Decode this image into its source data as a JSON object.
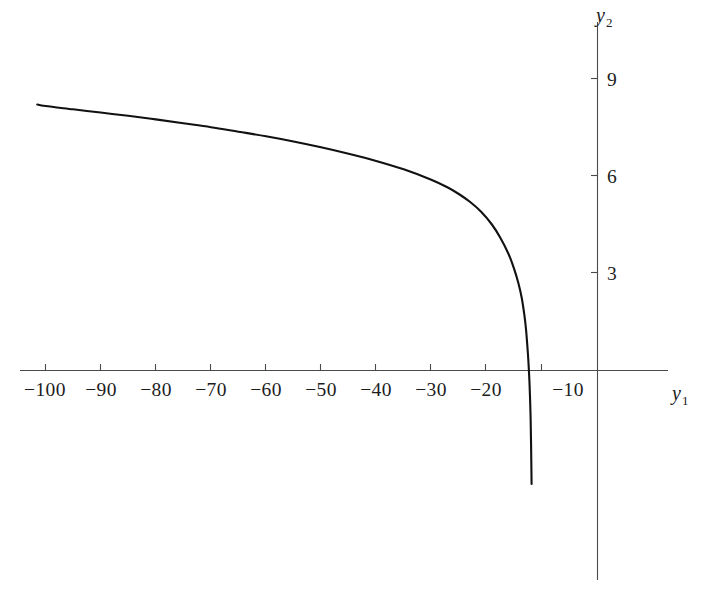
{
  "chart_data": {
    "type": "line",
    "title": "",
    "subtitle": "",
    "xlabel": "y_1",
    "ylabel": "y_2",
    "xlabel_base": "y",
    "xlabel_sub": "1",
    "ylabel_base": "y",
    "ylabel_sub": "2",
    "grid": false,
    "legend": null,
    "xlim": [
      -107,
      -2
    ],
    "ylim": [
      -3.6,
      10.6
    ],
    "xticks": [
      -100,
      -90,
      -80,
      -70,
      -60,
      -50,
      -40,
      -30,
      -20,
      -10
    ],
    "xtick_labels": [
      "−100",
      "−90",
      "−80",
      "−70",
      "−60",
      "−50",
      "−40",
      "−30",
      "−20",
      "−10"
    ],
    "yticks": [
      3,
      6,
      9
    ],
    "ytick_labels": [
      "3",
      "6",
      "9"
    ],
    "axis_color": "#4a4a4a",
    "curve_color": "#111111",
    "background_color": "#ffffff",
    "asymptote_x": -11.3,
    "series": [
      {
        "name": "curve",
        "description": "Decreasing curve with vertical asymptote near y1 = -11.3; crosses the horizontal axis near y1 = -12.4",
        "x": [
          -101.5,
          -100,
          -95,
          -90,
          -85,
          -80,
          -75,
          -70,
          -65,
          -60,
          -55,
          -50,
          -45,
          -40,
          -35,
          -30,
          -27,
          -25,
          -23,
          -21,
          -19,
          -17.5,
          -16,
          -15,
          -14.2,
          -13.6,
          -13.1,
          -12.8,
          -12.5,
          -12.35,
          -12.2,
          -12.1,
          -12.0,
          -11.95,
          -11.9,
          -11.85,
          -11.8
        ],
        "y": [
          8.2,
          8.15,
          8.05,
          7.95,
          7.85,
          7.74,
          7.62,
          7.5,
          7.36,
          7.22,
          7.06,
          6.88,
          6.68,
          6.46,
          6.2,
          5.88,
          5.64,
          5.44,
          5.2,
          4.9,
          4.5,
          4.1,
          3.6,
          3.15,
          2.7,
          2.25,
          1.7,
          1.25,
          0.6,
          0.2,
          -0.3,
          -0.75,
          -1.3,
          -1.7,
          -2.2,
          -2.8,
          -3.5
        ]
      }
    ]
  },
  "figure": {
    "x_axis_name": "y-sub-1",
    "y_axis_name": "y-sub-2"
  }
}
